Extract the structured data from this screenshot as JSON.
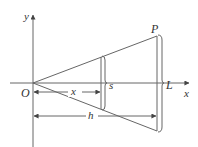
{
  "diagram": {
    "type": "geometry-figure",
    "labels": {
      "y_axis": "y",
      "x_axis": "x",
      "origin": "O",
      "point_p": "P",
      "cross_section": "s",
      "end_length": "L",
      "distance_x": "x",
      "distance_h": "h"
    },
    "colors": {
      "line": "#666666",
      "text": "#333333",
      "background": "#ffffff"
    }
  }
}
